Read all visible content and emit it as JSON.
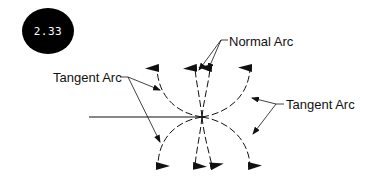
{
  "figure": {
    "badge_label": "2.33",
    "labels": {
      "normal_arc": "Normal Arc",
      "tangent_arc_left": "Tangent Arc",
      "tangent_arc_right": "Tangent Arc"
    },
    "colors": {
      "ink": "#111111",
      "badge_bg": "#000000",
      "badge_text": "#ffffff",
      "background": "#ffffff"
    }
  }
}
